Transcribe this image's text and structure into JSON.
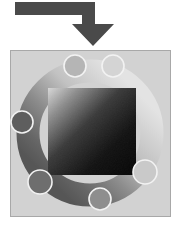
{
  "canvas": {
    "width": 180,
    "height": 225,
    "background": "#ffffff"
  },
  "arrow": {
    "name": "elbow-down-arrow",
    "color": "#4a4a4a",
    "description": "Elbow arrow entering from left, turning downward into the panel",
    "horizontal_bar": {
      "x": 15,
      "y": 2,
      "width": 80,
      "height": 13
    },
    "shaft": {
      "x": 82,
      "y": 2,
      "width": 13,
      "height": 24
    },
    "head": {
      "left": 72,
      "right": 114,
      "top": 24,
      "tip_x": 93,
      "tip_y": 46
    }
  },
  "panel": {
    "name": "diagram-panel",
    "x": 10,
    "y": 50,
    "width": 160,
    "height": 166,
    "fill": "#d2d2d2",
    "border_color": "#a8a8a8",
    "border_width": 1
  },
  "ring": {
    "name": "gradient-ring",
    "center_x": 90,
    "center_y": 133,
    "radius": 62,
    "stroke_width": 23,
    "gradient_stops": [
      {
        "offset": "0%",
        "color": "#e3e3e3"
      },
      {
        "offset": "35%",
        "color": "#c2c2c2"
      },
      {
        "offset": "62%",
        "color": "#8c8c8c"
      },
      {
        "offset": "85%",
        "color": "#666666"
      },
      {
        "offset": "100%",
        "color": "#565656"
      }
    ],
    "gradient_angle_deg": 135
  },
  "square": {
    "name": "gradient-square",
    "x": 48,
    "y": 88,
    "width": 88,
    "height": 87,
    "gradient_stops": [
      {
        "offset": "0%",
        "color": "#d8d8d8"
      },
      {
        "offset": "18%",
        "color": "#8e8e8e"
      },
      {
        "offset": "42%",
        "color": "#3a3a3a"
      },
      {
        "offset": "70%",
        "color": "#121212"
      },
      {
        "offset": "100%",
        "color": "#050505"
      }
    ],
    "gradient_direction": "top-left to bottom-right"
  },
  "nodes": [
    {
      "id": "node-top-left",
      "name": "ring-node-1",
      "cx": 75,
      "cy": 66,
      "r": 11,
      "fill": "#b5b5b5",
      "stroke": "#f2f2f2"
    },
    {
      "id": "node-top-right",
      "name": "ring-node-2",
      "cx": 113,
      "cy": 66,
      "r": 11,
      "fill": "#d4d4d4",
      "stroke": "#f2f2f2"
    },
    {
      "id": "node-right",
      "name": "ring-node-3",
      "cx": 145,
      "cy": 172,
      "r": 12,
      "fill": "#c9c9c9",
      "stroke": "#f2f2f2"
    },
    {
      "id": "node-bottom",
      "name": "ring-node-4",
      "cx": 100,
      "cy": 199,
      "r": 11,
      "fill": "#8e8e8e",
      "stroke": "#f2f2f2"
    },
    {
      "id": "node-bottom-left",
      "name": "ring-node-5",
      "cx": 40,
      "cy": 182,
      "r": 12,
      "fill": "#6e6e6e",
      "stroke": "#f2f2f2"
    },
    {
      "id": "node-left",
      "name": "ring-node-6",
      "cx": 22,
      "cy": 122,
      "r": 11,
      "fill": "#5e5e5e",
      "stroke": "#f2f2f2"
    }
  ]
}
